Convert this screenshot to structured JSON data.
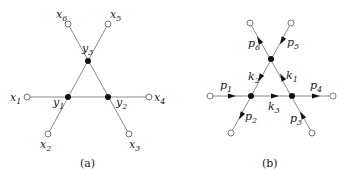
{
  "panels": [
    {
      "id": "a",
      "caption": "(a)",
      "internal_vertices": [
        {
          "name": "y",
          "sub": "1"
        },
        {
          "name": "y",
          "sub": "2"
        },
        {
          "name": "y",
          "sub": "3"
        }
      ],
      "external_vertices": [
        {
          "name": "x",
          "sub": "1"
        },
        {
          "name": "x",
          "sub": "2"
        },
        {
          "name": "x",
          "sub": "3"
        },
        {
          "name": "x",
          "sub": "4"
        },
        {
          "name": "x",
          "sub": "5"
        },
        {
          "name": "x",
          "sub": "6"
        }
      ]
    },
    {
      "id": "b",
      "caption": "(b)",
      "internal_momenta": [
        {
          "name": "k",
          "sub": "1"
        },
        {
          "name": "k",
          "sub": "2"
        },
        {
          "name": "k",
          "sub": "3"
        }
      ],
      "external_momenta": [
        {
          "name": "p",
          "sub": "1"
        },
        {
          "name": "p",
          "sub": "2"
        },
        {
          "name": "p",
          "sub": "3"
        },
        {
          "name": "p",
          "sub": "4"
        },
        {
          "name": "p",
          "sub": "5"
        },
        {
          "name": "p",
          "sub": "6"
        }
      ]
    }
  ],
  "colors": {
    "edge": "#8a8a8a",
    "vertex_filled": "#111111",
    "vertex_hollow_stroke": "#6a6a6a"
  }
}
